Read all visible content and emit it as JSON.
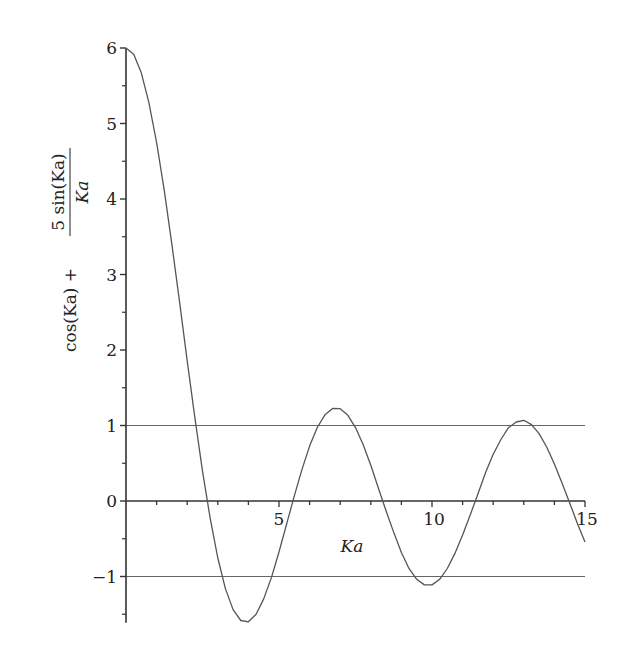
{
  "chart_data": {
    "type": "line",
    "title": "",
    "xlabel": "Ka",
    "ylabel": {
      "numerator_left": "cos(Ka) +",
      "fraction_numerator": "5 sin(Ka)",
      "fraction_denominator": "Ka",
      "full": "cos(Ka) + 5 sin(Ka)/Ka"
    },
    "xlim": [
      0,
      15
    ],
    "ylim": [
      -1.6,
      6
    ],
    "x_ticks": [
      {
        "value": 5,
        "label": "5"
      },
      {
        "value": 10,
        "label": "10"
      },
      {
        "value": 15,
        "label": "15"
      }
    ],
    "x_minor_step": 1,
    "y_ticks": [
      {
        "value": 6,
        "label": "6"
      },
      {
        "value": 5,
        "label": "5"
      },
      {
        "value": 4,
        "label": "4"
      },
      {
        "value": 3,
        "label": "3"
      },
      {
        "value": 2,
        "label": "2"
      },
      {
        "value": 1,
        "label": "1"
      },
      {
        "value": 0,
        "label": "0"
      },
      {
        "value": -1,
        "label": "−1"
      }
    ],
    "y_minor_step": 0.5,
    "grid": false,
    "legend": null,
    "reference_lines": [
      {
        "y": 1,
        "label": "y = 1"
      },
      {
        "y": -1,
        "label": "y = -1"
      }
    ],
    "series": [
      {
        "name": "cos(Ka) + 5 sin(Ka)/Ka",
        "color": "#555555",
        "x": [
          0,
          0.25,
          0.5,
          0.75,
          1,
          1.25,
          1.5,
          1.75,
          2,
          2.25,
          2.5,
          2.75,
          3,
          3.25,
          3.5,
          3.75,
          4,
          4.25,
          4.5,
          4.75,
          5,
          5.25,
          5.5,
          5.75,
          6,
          6.25,
          6.5,
          6.75,
          7,
          7.25,
          7.5,
          7.75,
          8,
          8.25,
          8.5,
          8.75,
          9,
          9.25,
          9.5,
          9.75,
          10,
          10.25,
          10.5,
          10.75,
          11,
          11.25,
          11.5,
          11.75,
          12,
          12.25,
          12.5,
          12.75,
          13,
          13.25,
          13.5,
          13.75,
          14,
          14.25,
          14.5,
          14.75,
          15
        ],
        "y": [
          6,
          5.917,
          5.672,
          5.276,
          4.748,
          4.111,
          3.396,
          2.633,
          1.857,
          1.101,
          0.396,
          -0.23,
          -0.755,
          -1.16,
          -1.438,
          -1.583,
          -1.6,
          -1.499,
          -1.297,
          -1.014,
          -0.675,
          -0.306,
          0.067,
          0.419,
          0.727,
          0.973,
          1.142,
          1.226,
          1.223,
          1.135,
          0.972,
          0.749,
          0.473,
          0.166,
          -0.132,
          -0.418,
          -0.682,
          -0.897,
          -1.037,
          -1.111,
          -1.111,
          -1.037,
          -0.894,
          -0.694,
          -0.45,
          -0.181,
          0.093,
          0.377,
          0.62,
          0.815,
          0.971,
          1.047,
          1.069,
          1.012,
          0.893,
          0.713,
          0.491,
          0.24,
          -0.027,
          -0.299,
          -0.543
        ]
      }
    ]
  },
  "colors": {
    "axis": "#333333",
    "curve": "#555555",
    "reference": "#666666",
    "text": "#222222"
  }
}
